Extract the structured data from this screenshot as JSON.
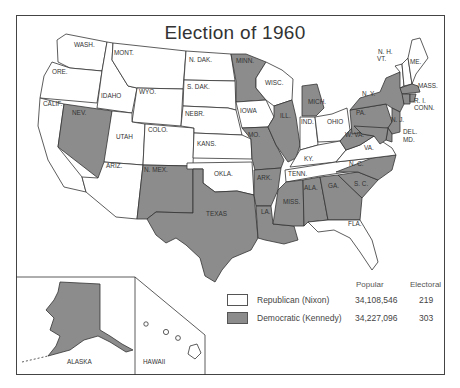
{
  "title": "Election of 1960",
  "colors": {
    "republican": "#ffffff",
    "democratic": "#8c8c8c",
    "border": "#333333"
  },
  "legend": {
    "headers": {
      "popular": "Popular",
      "electoral": "Electoral"
    },
    "rows": [
      {
        "party": "Republican (Nixon)",
        "popular": "34,108,546",
        "electoral": "219",
        "color": "#ffffff"
      },
      {
        "party": "Democratic (Kennedy)",
        "popular": "34,227,096",
        "electoral": "303",
        "color": "#8c8c8c"
      }
    ]
  },
  "insets": {
    "alaska": "ALASKA",
    "hawaii": "HAWAII"
  },
  "state_labels": {
    "wash": "WASH.",
    "ore": "ORE.",
    "calif": "CALIF.",
    "idaho": "IDAHO",
    "nev": "NEV.",
    "mont": "MONT.",
    "wyo": "WYO.",
    "utah": "UTAH",
    "ariz": "ARIZ.",
    "colo": "COLO.",
    "nmex": "N. MEX.",
    "ndak": "N. DAK.",
    "sdak": "S. DAK.",
    "nebr": "NEBR.",
    "kans": "KANS.",
    "okla": "OKLA.",
    "texas": "TEXAS",
    "minn": "MINN.",
    "iowa": "IOWA",
    "mo": "MO.",
    "ark": "ARK.",
    "la": "LA.",
    "wisc": "WISC.",
    "ill": "ILL.",
    "mich": "MICH.",
    "ind": "IND.",
    "ohio": "OHIO",
    "ky": "KY.",
    "tenn": "TENN.",
    "miss": "MISS.",
    "ala": "ALA.",
    "ga": "GA.",
    "fla": "FLA.",
    "sc": "S. C.",
    "nc": "N. C.",
    "va": "VA.",
    "wva": "W. VA.",
    "pa": "PA.",
    "ny": "N. Y.",
    "nj": "N. J.",
    "del": "DEL.",
    "md": "MD.",
    "conn": "CONN.",
    "ri": "R. I.",
    "mass": "MASS.",
    "vt": "VT.",
    "nh": "N. H.",
    "me": "ME."
  },
  "outcome": {
    "democratic": [
      "NEV.",
      "N. MEX.",
      "TEXAS",
      "MINN.",
      "MO.",
      "ARK.",
      "LA.",
      "ILL.",
      "MICH.",
      "MISS.",
      "ALA.",
      "GA.",
      "S. C.",
      "N. C.",
      "W. VA.",
      "PA.",
      "N. Y.",
      "N. J.",
      "DEL.",
      "MD.",
      "CONN.",
      "R. I.",
      "MASS.",
      "ALASKA"
    ],
    "republican": [
      "WASH.",
      "ORE.",
      "CALIF.",
      "IDAHO",
      "MONT.",
      "WYO.",
      "UTAH",
      "ARIZ.",
      "COLO.",
      "N. DAK.",
      "S. DAK.",
      "NEBR.",
      "KANS.",
      "OKLA.",
      "IOWA",
      "WISC.",
      "IND.",
      "OHIO",
      "KY.",
      "TENN.",
      "FLA.",
      "VA.",
      "VT.",
      "N. H.",
      "ME.",
      "HAWAII"
    ]
  }
}
